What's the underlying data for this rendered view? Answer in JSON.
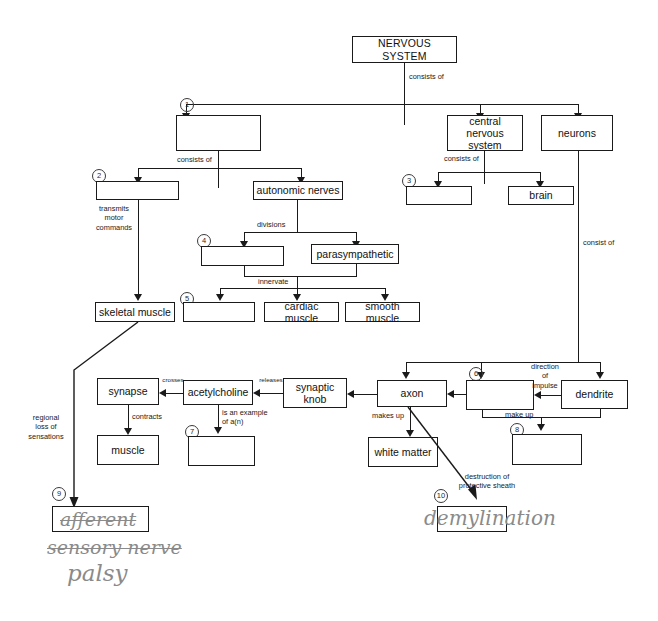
{
  "diagram": {
    "title_box": "NERVOUS SYSTEM",
    "nodes": {
      "n1_blank": "",
      "central_nervous_system": "central nervous\nsystem",
      "neurons": "neurons",
      "n2_blank": "",
      "autonomic_nerves": "autonomic nerves",
      "n3_blank": "",
      "brain": "brain",
      "n4_blank": "",
      "parasympathetic": "parasympathetic",
      "skeletal_muscle": "skeletal muscle",
      "n5_blank": "",
      "cardiac_muscle": "cardiac muscle",
      "smooth_muscle": "smooth muscle",
      "synapse": "synapse",
      "acetylcholine": "acetylcholine",
      "synaptic_knob": "synaptic\nknob",
      "axon": "axon",
      "n6_blank": "",
      "dendrite": "dendrite",
      "muscle": "muscle",
      "n7_blank": "",
      "white_matter": "white matter",
      "n8_blank": "",
      "n9_blank": "",
      "n10_blank": ""
    },
    "edge_labels": {
      "consists_of_top": "consists of",
      "consists_of_left": "consists of",
      "consists_of_cns": "consists of",
      "transmits_motor_commands": "transmits\nmotor\ncommands",
      "divisions": "divisions",
      "innervate": "innervate",
      "consist_of": "consist of",
      "regional_loss": "regional\nloss of\nsensations",
      "crosses": "crosses",
      "releases": "releases",
      "contracts": "contracts",
      "is_an_example": "is an example\nof a(n)",
      "makes_up": "makes up",
      "make_up": "make up",
      "direction_of_impulse": "direction\nof\nimpulse",
      "destruction": "destruction of\nprotective sheath"
    },
    "blank_numbers": {
      "one": "1",
      "two": "2",
      "three": "3",
      "four": "4",
      "five": "5",
      "six": "6",
      "seven": "7",
      "eight": "8",
      "nine": "9",
      "ten": "10"
    },
    "handwriting": {
      "answer9_struck": "afferent",
      "note_sensory_nerve": "sensory nerve",
      "note_palsy": "palsy",
      "answer10": "demylination"
    },
    "colors": {
      "ink": "#1a1a1a",
      "pencil": "#8a8a8a",
      "paper": "#ffffff"
    }
  }
}
